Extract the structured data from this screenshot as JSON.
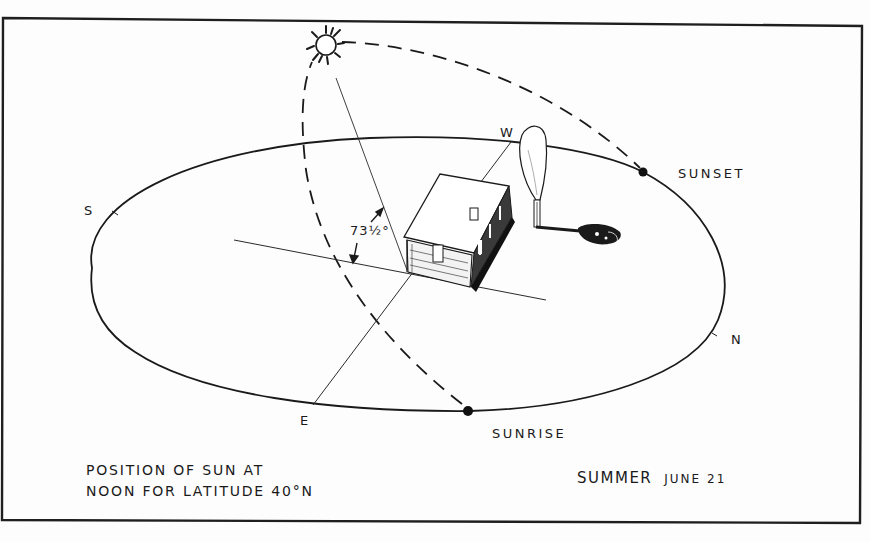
{
  "figure": {
    "title_line_1": "POSITION OF SUN AT",
    "title_line_2": "NOON FOR LATITUDE 40°N",
    "season": "SUMMER",
    "date": "JUNE 21",
    "angle_label": "73½°",
    "events": {
      "sunset": "SUNSET",
      "sunrise": "SUNRISE"
    },
    "directions": {
      "south": "S",
      "north": "N",
      "east": "E",
      "west": "W"
    },
    "colors": {
      "ink": "#1a1a1a",
      "paper": "#fdfdfd"
    },
    "elements": [
      "sun-icon",
      "horizon-ellipse",
      "sun-arc-dashed",
      "house-icon",
      "tree-icon",
      "tree-shadow",
      "sunrise-dot",
      "sunset-dot",
      "east-west-line",
      "north-south-line",
      "sun-ray-line",
      "angle-arrows"
    ]
  }
}
